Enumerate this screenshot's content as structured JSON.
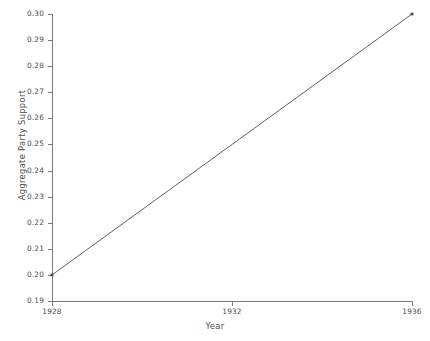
{
  "chart_data": {
    "type": "line",
    "title": "",
    "xlabel": "Year",
    "ylabel": "Aggregate Party Support",
    "xlim": [
      1928,
      1936
    ],
    "ylim": [
      0.19,
      0.3
    ],
    "xticks": [
      1928,
      1932,
      1936
    ],
    "xtick_labels": [
      "1928",
      "1932",
      "1936"
    ],
    "yticks": [
      0.19,
      0.2,
      0.21,
      0.22,
      0.23,
      0.24,
      0.25,
      0.26,
      0.27,
      0.28,
      0.29,
      0.3
    ],
    "ytick_labels": [
      "0.19",
      "0.20",
      "0.21",
      "0.22",
      "0.23",
      "0.24",
      "0.25",
      "0.26",
      "0.27",
      "0.28",
      "0.29",
      "0.30"
    ],
    "grid": false,
    "legend": false,
    "series": [
      {
        "name": "Aggregate Party Support",
        "color": "#4d4d4d",
        "x": [
          1928,
          1936
        ],
        "values": [
          0.2,
          0.3
        ]
      }
    ],
    "annotations": []
  },
  "axes": {
    "line_color": "#7a7a7a",
    "text_color": "#4d4d4d",
    "background": "#ffffff"
  }
}
